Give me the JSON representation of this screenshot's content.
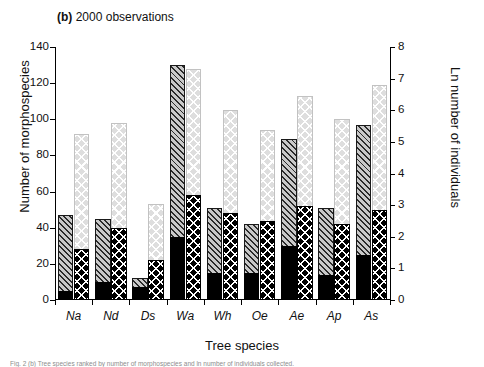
{
  "panel": {
    "letter": "(b)",
    "title": "2000 observations"
  },
  "axes": {
    "left": {
      "label": "Number of morphospecies",
      "min": 0,
      "max": 140,
      "ticks": [
        0,
        20,
        40,
        60,
        80,
        100,
        120,
        140
      ]
    },
    "right": {
      "label": "Ln number of individuals",
      "min": 0,
      "max": 8,
      "ticks": [
        0,
        1,
        2,
        3,
        4,
        5,
        6,
        7,
        8
      ]
    },
    "x": {
      "label": "Tree species"
    }
  },
  "caption": "Fig. 2 (b) Tree species ranked by number of morphospecies and ln number of individuals collected.",
  "chart_data": {
    "type": "bar",
    "title": "(b) 2000 observations",
    "xlabel": "Tree species",
    "ylabel": "Number of morphospecies",
    "ylabel_secondary": "Ln number of individuals",
    "ylim": [
      0,
      140
    ],
    "ylim_secondary": [
      0,
      8
    ],
    "grid": false,
    "legend": "none",
    "categories": [
      "Na",
      "Nd",
      "Ds",
      "Wa",
      "Wh",
      "Oe",
      "Ae",
      "Ap",
      "As"
    ],
    "series": [
      {
        "name": "Morphospecies total",
        "axis": "left",
        "pattern": "diagonal-hatch-grey",
        "values": [
          47,
          45,
          12,
          130,
          51,
          42,
          89,
          51,
          97
        ]
      },
      {
        "name": "Morphospecies singletons",
        "axis": "left",
        "pattern": "solid-black",
        "values": [
          5,
          10,
          7,
          35,
          15,
          15,
          30,
          14,
          25
        ]
      },
      {
        "name": "Ln individuals total",
        "axis": "right",
        "pattern": "light-crosshatch",
        "values": [
          5.3,
          5.6,
          3.05,
          7.3,
          6.0,
          5.4,
          6.45,
          5.75,
          6.8
        ]
      },
      {
        "name": "Ln individuals subset",
        "axis": "right",
        "pattern": "black-crosshatch",
        "values": [
          1.6,
          2.3,
          1.25,
          3.3,
          2.75,
          2.5,
          2.95,
          2.4,
          2.85
        ]
      }
    ],
    "series_left_secondary_in_left_units": {
      "note": "right-axis bars drawn in left-axis pixel units",
      "total": [
        92,
        98,
        53,
        128,
        105,
        94,
        113,
        100,
        119
      ],
      "base": [
        28,
        40,
        22,
        58,
        48,
        44,
        52,
        42,
        50
      ]
    }
  }
}
